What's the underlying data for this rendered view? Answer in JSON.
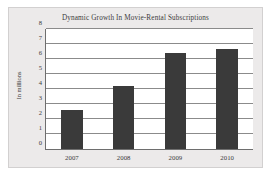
{
  "chart_data": {
    "type": "bar",
    "title": "Dynamic Growth In Movie-Rental Subscriptions",
    "xlabel": "",
    "ylabel": "In millions",
    "categories": [
      "2007",
      "2008",
      "2009",
      "2010"
    ],
    "values": [
      2.6,
      4.2,
      6.4,
      6.7
    ],
    "ylim": [
      0,
      8
    ],
    "ytick_labels": [
      "0",
      "1",
      "2",
      "3",
      "4",
      "5",
      "6",
      "7",
      "8"
    ],
    "ytick_values": [
      0,
      1,
      2,
      3,
      4,
      5,
      6,
      7,
      8
    ],
    "grid": true,
    "legend": false,
    "series_color": "#3a3a3a",
    "plot_background": "#ffffff",
    "panel_background": "#eceaea",
    "axis_color": "#6e6e6e",
    "gridline_color": "#8b8b8b",
    "text_color": "#3c3c3c"
  }
}
